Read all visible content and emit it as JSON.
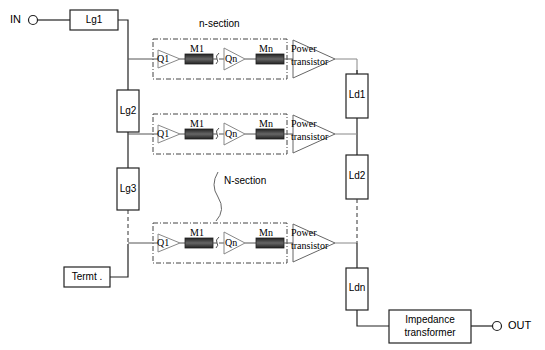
{
  "ports": {
    "input": "IN",
    "output": "OUT"
  },
  "gate_lines": [
    "Lg1",
    "Lg2",
    "Lg3"
  ],
  "drain_lines": [
    "Ld1",
    "Ld2",
    "Ldn"
  ],
  "termination": "Termt .",
  "impedance": {
    "line1": "Impedance",
    "line2": "transformer"
  },
  "section_labels": {
    "n_section": "n-section",
    "N_section": "N-section"
  },
  "stage": {
    "q1": "Q1",
    "m1": "M1",
    "qn": "Qn",
    "mn": "Mn",
    "pt1": "Power",
    "pt2": "transistor"
  },
  "colors": {
    "line": "#111111",
    "dashed": "#333333",
    "matching": "#3a3a3a"
  }
}
